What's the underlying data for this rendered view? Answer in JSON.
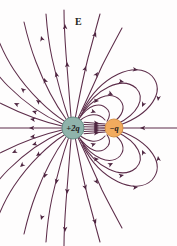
{
  "figure": {
    "title_label": "E",
    "background_color": "#fefdfd",
    "field_line_color": "#5d2d4a",
    "arrow_color": "#4e2540"
  },
  "charges": {
    "positive": {
      "label": "+2q",
      "sign": "positive",
      "magnitude": 2,
      "fill_color": "#8fb3ab",
      "stroke_color": "#5f867e",
      "cx": 73,
      "cy": 128,
      "r": 11
    },
    "negative": {
      "label": "−q",
      "sign": "negative",
      "magnitude": 1,
      "fill_color": "#f2ab5e",
      "stroke_color": "#cf8a3e",
      "cx": 114,
      "cy": 128,
      "r": 9
    }
  },
  "chart_data": {
    "type": "diagram",
    "subtype": "electric-field-lines",
    "title": "E",
    "xlabel": "",
    "ylabel": "",
    "grid": false,
    "legend": false,
    "objects": [
      {
        "name": "positive-charge",
        "label": "+2q",
        "charge": 2,
        "x": 73,
        "y": 128,
        "radius": 11,
        "color": "#8fb3ab"
      },
      {
        "name": "negative-charge",
        "label": "−q",
        "charge": -1,
        "x": 114,
        "y": 128,
        "radius": 9,
        "color": "#f2ab5e"
      }
    ],
    "field_line_count": 36,
    "lines_terminating_on_negative": 18,
    "lines_escaping_to_infinity": 18,
    "arrow_direction_rule": "away from +2q, into -q",
    "notes": [
      "Twice as many lines leave +2q as enter -q, reflecting the 2:1 charge ratio.",
      "Half of the lines from +2q terminate on -q; the other half escape outward.",
      "One field line arrives horizontally from the far right into the -q charge."
    ]
  }
}
